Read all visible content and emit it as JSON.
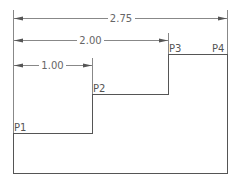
{
  "diagram": {
    "type": "stepped-profile-dimension-drawing",
    "points": [
      {
        "label": "P1"
      },
      {
        "label": "P2"
      },
      {
        "label": "P3"
      },
      {
        "label": "P4"
      }
    ],
    "dimensions": [
      {
        "label": "2.75",
        "from": "left-edge",
        "to": "P4"
      },
      {
        "label": "2.00",
        "from": "left-edge",
        "to": "P3"
      },
      {
        "label": "1.00",
        "from": "left-edge",
        "to": "P2"
      }
    ],
    "colors": {
      "outline": "#555555",
      "dimension": "#888888",
      "background": "#ffffff"
    }
  }
}
